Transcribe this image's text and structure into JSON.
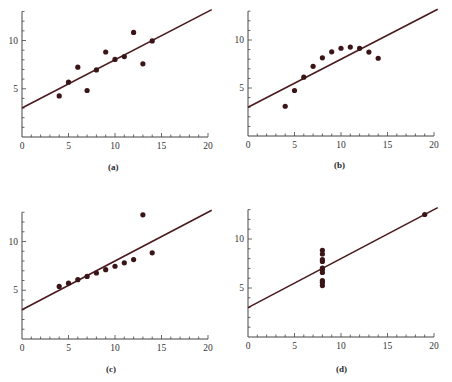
{
  "colors": {
    "axis": "#444444",
    "line": "#4a1a1e",
    "point": "#3a1518",
    "text": "#333333"
  },
  "chart_data": [
    {
      "type": "scatter",
      "panel": "(a)",
      "caption": "(a)",
      "xlim": [
        0,
        20
      ],
      "ylim": [
        0,
        13
      ],
      "xticks": [
        0,
        5,
        10,
        15,
        20
      ],
      "yticks": [
        5,
        10
      ],
      "grid": false,
      "x": [
        10,
        8,
        13,
        9,
        11,
        14,
        6,
        4,
        12,
        7,
        5
      ],
      "y": [
        8.04,
        6.95,
        7.58,
        8.81,
        8.33,
        9.96,
        7.24,
        4.26,
        10.84,
        4.82,
        5.68
      ],
      "fit_line": {
        "intercept": 3.0,
        "slope": 0.5
      }
    },
    {
      "type": "scatter",
      "panel": "(b)",
      "caption": "(b)",
      "xlim": [
        0,
        20
      ],
      "ylim": [
        0,
        13
      ],
      "xticks": [
        0,
        5,
        10,
        15,
        20
      ],
      "yticks": [
        5,
        10
      ],
      "grid": false,
      "x": [
        10,
        8,
        13,
        9,
        11,
        14,
        6,
        4,
        12,
        7,
        5
      ],
      "y": [
        9.14,
        8.14,
        8.74,
        8.77,
        9.26,
        8.1,
        6.13,
        3.1,
        9.13,
        7.26,
        4.74
      ],
      "fit_line": {
        "intercept": 3.0,
        "slope": 0.5
      }
    },
    {
      "type": "scatter",
      "panel": "(c)",
      "caption": "(c)",
      "xlim": [
        0,
        20
      ],
      "ylim": [
        0,
        13
      ],
      "xticks": [
        0,
        5,
        10,
        15,
        20
      ],
      "yticks": [
        5,
        10
      ],
      "grid": false,
      "x": [
        10,
        8,
        13,
        9,
        11,
        14,
        6,
        4,
        12,
        7,
        5
      ],
      "y": [
        7.46,
        6.77,
        12.74,
        7.11,
        7.81,
        8.84,
        6.08,
        5.39,
        8.15,
        6.42,
        5.73
      ],
      "fit_line": {
        "intercept": 3.0,
        "slope": 0.5
      }
    },
    {
      "type": "scatter",
      "panel": "(d)",
      "caption": "(d)",
      "xlim": [
        0,
        20
      ],
      "ylim": [
        0,
        13
      ],
      "xticks": [
        0,
        5,
        10,
        15,
        20
      ],
      "yticks": [
        5,
        10
      ],
      "grid": false,
      "x": [
        8,
        8,
        8,
        8,
        8,
        8,
        8,
        19,
        8,
        8,
        8
      ],
      "y": [
        6.58,
        5.76,
        7.71,
        8.84,
        8.47,
        7.04,
        5.25,
        12.5,
        5.56,
        7.91,
        6.89
      ],
      "fit_line": {
        "intercept": 3.0,
        "slope": 0.5
      }
    }
  ],
  "panels": [
    {
      "caption": "(a)",
      "tick_labels_x": [
        "0",
        "5",
        "10",
        "15",
        "20"
      ],
      "tick_labels_y": [
        "5",
        "10"
      ]
    },
    {
      "caption": "(b)",
      "tick_labels_x": [
        "0",
        "5",
        "10",
        "15",
        "20"
      ],
      "tick_labels_y": [
        "5",
        "10"
      ]
    },
    {
      "caption": "(c)",
      "tick_labels_x": [
        "0",
        "5",
        "10",
        "15",
        "20"
      ],
      "tick_labels_y": [
        "5",
        "10"
      ]
    },
    {
      "caption": "(d)",
      "tick_labels_x": [
        "0",
        "5",
        "10",
        "15",
        "20"
      ],
      "tick_labels_y": [
        "5",
        "10"
      ]
    }
  ]
}
